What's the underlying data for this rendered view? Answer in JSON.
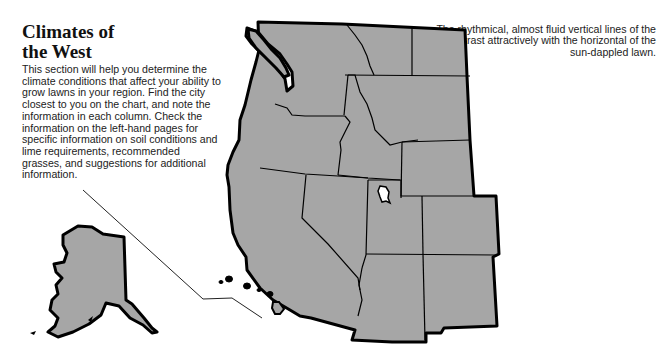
{
  "heading": {
    "line1": "Climates of",
    "line2": "the West"
  },
  "intro": {
    "text": "This section will help you determine the climate conditions that affect your ability to grow lawns in your region. Find the city closest to you on the chart, and note the information in each column. Check the information on the left-hand pages for specific information on soil conditions and lime requirements, recommended grasses, and suggestions for additional information."
  },
  "caption": {
    "text": "The rhythmical, almost fluid vertical lines of the trees contrast attractively with the horizontal of the sun-dappled lawn."
  },
  "map": {
    "fill_color": "#a6a6a6",
    "border_color": "#000000",
    "regions": [
      "Washington",
      "Oregon",
      "California",
      "Idaho",
      "Nevada",
      "Montana",
      "Wyoming",
      "Utah",
      "Colorado",
      "Arizona",
      "New Mexico",
      "Alaska",
      "Hawaii"
    ]
  }
}
